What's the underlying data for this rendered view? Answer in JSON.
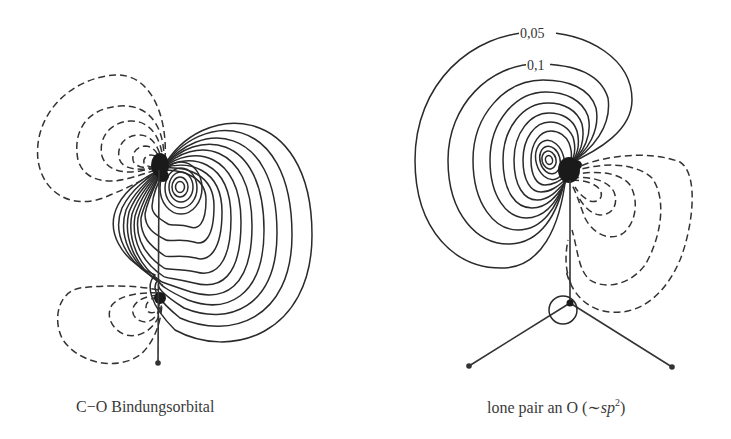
{
  "panels": [
    {
      "id": "left",
      "caption": "C−O Bindungsorbital",
      "description": "C-O bonding orbital contour plot: positive (solid) lobe between atoms, negative (dashed) lobes on the back sides"
    },
    {
      "id": "right",
      "caption_prefix": "lone pair an O (∼",
      "caption_italic": "sp",
      "caption_sup": "2",
      "caption_suffix": ")",
      "contour_labels": [
        "0,05",
        "0,1"
      ],
      "description": "Oxygen lone pair (~sp2) contour plot with positive (solid) lobe and negative (dashed) lobe, molecular frame below"
    }
  ],
  "legend": {
    "solid": "positive contours",
    "dashed": "negative contours"
  },
  "colors": {
    "line": "#2a2a2a",
    "text": "#3a3a3a",
    "background": "#ffffff"
  }
}
